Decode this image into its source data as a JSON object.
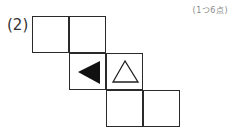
{
  "question": {
    "number_label": "(2)",
    "points_label": "(1つ6点)"
  },
  "net": {
    "cells": [
      {
        "col": 0,
        "row": 0,
        "symbol": ""
      },
      {
        "col": 1,
        "row": 0,
        "symbol": ""
      },
      {
        "col": 1,
        "row": 1,
        "symbol": "filled-triangle-left"
      },
      {
        "col": 2,
        "row": 1,
        "symbol": "outline-triangle-up"
      },
      {
        "col": 2,
        "row": 2,
        "symbol": ""
      },
      {
        "col": 3,
        "row": 2,
        "symbol": ""
      }
    ]
  }
}
